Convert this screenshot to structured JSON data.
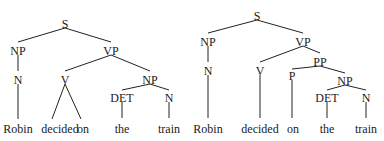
{
  "trees": [
    {
      "id": "left",
      "description": "VP -> V NP, where V dominates both 'decided' and 'on'",
      "nodes": [
        {
          "id": "S",
          "label": "S",
          "x": 65,
          "y": 24
        },
        {
          "id": "NP1",
          "label": "NP",
          "x": 18,
          "y": 51
        },
        {
          "id": "VP",
          "label": "VP",
          "x": 111,
          "y": 51
        },
        {
          "id": "N1",
          "label": "N",
          "x": 18,
          "y": 80
        },
        {
          "id": "V",
          "label": "V",
          "x": 65,
          "y": 80
        },
        {
          "id": "NP2",
          "label": "NP",
          "x": 150,
          "y": 80
        },
        {
          "id": "DET",
          "label": "DET",
          "x": 122,
          "y": 98
        },
        {
          "id": "N2",
          "label": "N",
          "x": 169,
          "y": 98
        }
      ],
      "words": [
        {
          "id": "w1",
          "label": "Robin",
          "x": 18,
          "y": 129
        },
        {
          "id": "w2",
          "label": "decided",
          "x": 60,
          "y": 129
        },
        {
          "id": "w3",
          "label": "on",
          "x": 83,
          "y": 129
        },
        {
          "id": "w4",
          "label": "the",
          "x": 122,
          "y": 129
        },
        {
          "id": "w5",
          "label": "train",
          "x": 169,
          "y": 129
        }
      ],
      "edges": [
        {
          "x1": 65,
          "y1": 28,
          "x2": 18,
          "y2": 42
        },
        {
          "x1": 65,
          "y1": 28,
          "x2": 111,
          "y2": 42
        },
        {
          "x1": 18,
          "y1": 55,
          "x2": 18,
          "y2": 71
        },
        {
          "x1": 111,
          "y1": 55,
          "x2": 65,
          "y2": 71
        },
        {
          "x1": 111,
          "y1": 55,
          "x2": 150,
          "y2": 71
        },
        {
          "x1": 18,
          "y1": 84,
          "x2": 18,
          "y2": 119
        },
        {
          "x1": 65,
          "y1": 84,
          "x2": 52,
          "y2": 119
        },
        {
          "x1": 65,
          "y1": 84,
          "x2": 81,
          "y2": 119
        },
        {
          "x1": 150,
          "y1": 84,
          "x2": 122,
          "y2": 90
        },
        {
          "x1": 150,
          "y1": 84,
          "x2": 169,
          "y2": 90
        },
        {
          "x1": 122,
          "y1": 102,
          "x2": 122,
          "y2": 118
        },
        {
          "x1": 169,
          "y1": 102,
          "x2": 169,
          "y2": 118
        }
      ]
    },
    {
      "id": "right",
      "description": "VP -> V PP, where PP -> P NP",
      "nodes": [
        {
          "id": "S",
          "label": "S",
          "x": 257,
          "y": 16
        },
        {
          "id": "NP1",
          "label": "NP",
          "x": 208,
          "y": 42
        },
        {
          "id": "VP",
          "label": "VP",
          "x": 303,
          "y": 42
        },
        {
          "id": "N1",
          "label": "N",
          "x": 208,
          "y": 71
        },
        {
          "id": "V",
          "label": "V",
          "x": 260,
          "y": 71
        },
        {
          "id": "PP",
          "label": "PP",
          "x": 320,
          "y": 62
        },
        {
          "id": "P",
          "label": "P",
          "x": 292,
          "y": 76
        },
        {
          "id": "NP2",
          "label": "NP",
          "x": 345,
          "y": 81
        },
        {
          "id": "DET",
          "label": "DET",
          "x": 327,
          "y": 98
        },
        {
          "id": "N2",
          "label": "N",
          "x": 366,
          "y": 98
        }
      ],
      "words": [
        {
          "id": "w1",
          "label": "Robin",
          "x": 208,
          "y": 129
        },
        {
          "id": "w2",
          "label": "decided",
          "x": 260,
          "y": 129
        },
        {
          "id": "w3",
          "label": "on",
          "x": 293,
          "y": 129
        },
        {
          "id": "w4",
          "label": "the",
          "x": 327,
          "y": 129
        },
        {
          "id": "w5",
          "label": "train",
          "x": 366,
          "y": 129
        }
      ],
      "edges": [
        {
          "x1": 257,
          "y1": 20,
          "x2": 208,
          "y2": 33
        },
        {
          "x1": 257,
          "y1": 20,
          "x2": 303,
          "y2": 33
        },
        {
          "x1": 208,
          "y1": 46,
          "x2": 208,
          "y2": 62
        },
        {
          "x1": 303,
          "y1": 46,
          "x2": 260,
          "y2": 62
        },
        {
          "x1": 303,
          "y1": 46,
          "x2": 320,
          "y2": 53
        },
        {
          "x1": 320,
          "y1": 66,
          "x2": 292,
          "y2": 69
        },
        {
          "x1": 320,
          "y1": 66,
          "x2": 345,
          "y2": 73
        },
        {
          "x1": 208,
          "y1": 75,
          "x2": 208,
          "y2": 118
        },
        {
          "x1": 260,
          "y1": 75,
          "x2": 260,
          "y2": 118
        },
        {
          "x1": 292,
          "y1": 80,
          "x2": 292,
          "y2": 118
        },
        {
          "x1": 345,
          "y1": 85,
          "x2": 327,
          "y2": 90
        },
        {
          "x1": 345,
          "y1": 85,
          "x2": 366,
          "y2": 90
        },
        {
          "x1": 327,
          "y1": 102,
          "x2": 327,
          "y2": 118
        },
        {
          "x1": 366,
          "y1": 102,
          "x2": 366,
          "y2": 118
        }
      ]
    }
  ]
}
